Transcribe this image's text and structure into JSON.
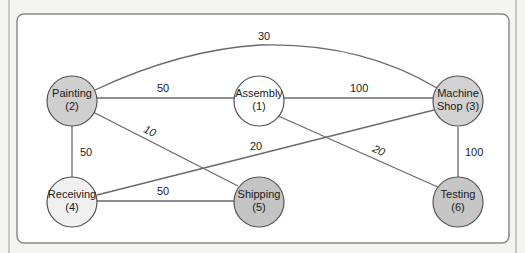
{
  "diagram": {
    "type": "weighted-graph",
    "nodes": [
      {
        "id": "1",
        "line1": "Assembly",
        "line2": "(1)",
        "fill": "#ffffff"
      },
      {
        "id": "2",
        "line1": "Painting",
        "line2": "(2)",
        "fill": "#cfcfcf"
      },
      {
        "id": "3",
        "line1": "Machine",
        "line2": "Shop (3)",
        "fill": "#d2d2d2"
      },
      {
        "id": "4",
        "line1": "Receiving",
        "line2": "(4)",
        "fill": "#f0f0f0"
      },
      {
        "id": "5",
        "line1": "Shipping",
        "line2": "(5)",
        "fill": "#c4c4c4"
      },
      {
        "id": "6",
        "line1": "Testing",
        "line2": "(6)",
        "fill": "#c6c6c6"
      }
    ],
    "edges": [
      {
        "from": "2",
        "to": "3",
        "weight": "30"
      },
      {
        "from": "2",
        "to": "1",
        "weight": "50"
      },
      {
        "from": "1",
        "to": "3",
        "weight": "100"
      },
      {
        "from": "2",
        "to": "5",
        "weight": "10"
      },
      {
        "from": "4",
        "to": "3",
        "weight": "20"
      },
      {
        "from": "1",
        "to": "6",
        "weight": "20"
      },
      {
        "from": "2",
        "to": "4",
        "weight": "50"
      },
      {
        "from": "4",
        "to": "5",
        "weight": "50"
      },
      {
        "from": "3",
        "to": "6",
        "weight": "100"
      }
    ]
  },
  "colors": {
    "edge": "#6a6a6a",
    "node_stroke": "#555555",
    "box_stroke": "#8a8a8a",
    "background": "#ffffff"
  }
}
